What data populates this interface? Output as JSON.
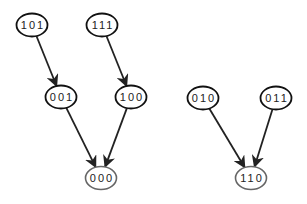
{
  "diagram": {
    "type": "directed-graph",
    "colors": {
      "node_stroke": "#111111",
      "sink_stroke": "#666666",
      "edge": "#222222",
      "text": "#222222",
      "background": "#ffffff"
    },
    "nodes": [
      {
        "id": "101",
        "label": "101",
        "cx": 32,
        "cy": 25,
        "sink": false
      },
      {
        "id": "111",
        "label": "111",
        "cx": 102,
        "cy": 25,
        "sink": false
      },
      {
        "id": "001",
        "label": "001",
        "cx": 61,
        "cy": 97,
        "sink": false
      },
      {
        "id": "100",
        "label": "100",
        "cx": 131,
        "cy": 97,
        "sink": false
      },
      {
        "id": "010",
        "label": "010",
        "cx": 203,
        "cy": 98,
        "sink": false
      },
      {
        "id": "011",
        "label": "011",
        "cx": 276,
        "cy": 98,
        "sink": false
      },
      {
        "id": "000",
        "label": "000",
        "cx": 101,
        "cy": 178,
        "sink": true
      },
      {
        "id": "110",
        "label": "110",
        "cx": 251,
        "cy": 178,
        "sink": true
      }
    ],
    "edges": [
      {
        "from": "101",
        "to": "001"
      },
      {
        "from": "111",
        "to": "100"
      },
      {
        "from": "001",
        "to": "000"
      },
      {
        "from": "100",
        "to": "000"
      },
      {
        "from": "010",
        "to": "110"
      },
      {
        "from": "011",
        "to": "110"
      }
    ]
  }
}
